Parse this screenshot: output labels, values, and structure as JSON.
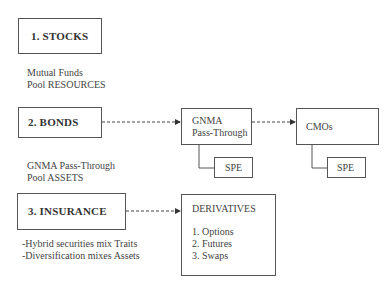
{
  "categories": [
    {
      "title": "1. STOCKS",
      "notes": [
        "Mutual Funds",
        "Pool RESOURCES"
      ]
    },
    {
      "title": "2. BONDS",
      "notes": [
        "GNMA Pass-Through",
        "Pool ASSETS"
      ]
    },
    {
      "title": "3. INSURANCE",
      "notes": [
        "-Hybrid securities mix Traits",
        "-Diversification mixes Assets"
      ]
    }
  ],
  "bond_chain": {
    "gnma": {
      "lines": [
        "GNMA",
        "Pass-Through"
      ],
      "sub": "SPE"
    },
    "cmos": {
      "label": "CMOs",
      "sub": "SPE"
    }
  },
  "derivatives": {
    "title": "DERIVATIVES",
    "items": [
      "1. Options",
      "2. Futures",
      "3. Swaps"
    ]
  },
  "colors": {
    "line": "#555555",
    "text": "#3a3a3a"
  }
}
